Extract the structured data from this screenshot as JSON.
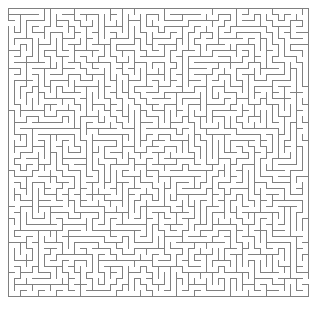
{
  "figure": {
    "kind": "maze-puzzle",
    "background_color": "#ffffff",
    "wall_color": "#808080",
    "wall_width_px": 1
  },
  "maze": {
    "cols": 50,
    "cells_rows": 48,
    "cell_size_px": 6,
    "origin_x_px": 8,
    "origin_y_px": 8,
    "width_px": 304,
    "height_px": 294,
    "entrance": {
      "side": "left",
      "cell_row": 2,
      "label": "start-opening"
    },
    "exit": {
      "side": "right",
      "cell_row": 45,
      "label": "end-opening"
    },
    "seed": 20250411,
    "algorithm": "recursive-backtracker"
  },
  "labels": {
    "figure_caption": ""
  }
}
